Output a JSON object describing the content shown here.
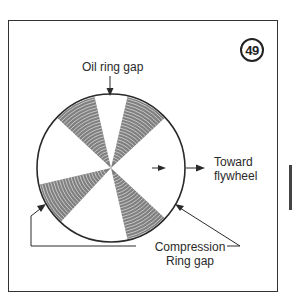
{
  "figure": {
    "number": "49",
    "labels": {
      "oil_ring_gap": "Oil ring gap",
      "toward_line1": "Toward",
      "toward_line2": "flywheel",
      "compression_line1": "Compression",
      "compression_line2": "Ring gap"
    },
    "colors": {
      "ink": "#2a2a2a",
      "hatch": "#555555",
      "background": "#ffffff"
    },
    "geometry": {
      "circle_center": [
        111,
        168
      ],
      "circle_radius": 74,
      "wedge_center_angles_deg": [
        -120,
        -60,
        150,
        60
      ],
      "wedge_half_width_deg": 17
    }
  }
}
